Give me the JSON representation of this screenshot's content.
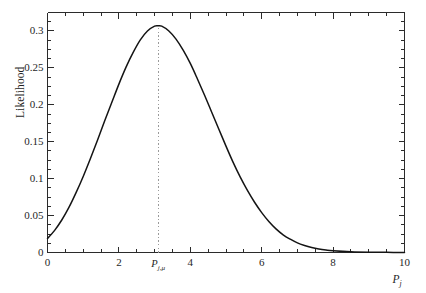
{
  "chart_data": {
    "type": "line",
    "title": "",
    "subtitle": "",
    "xlabel": "P_j",
    "xlabel_base": "P",
    "xlabel_sub": "j",
    "ylabel": "Likelihood",
    "xlim": [
      0,
      10
    ],
    "ylim": [
      0,
      0.325
    ],
    "grid": false,
    "legend": null,
    "x_ticks_major": [
      0,
      2,
      4,
      6,
      8,
      10
    ],
    "x_tick_labels": [
      "0",
      "2",
      "4",
      "6",
      "8",
      "10"
    ],
    "x_minor_step": 0.5,
    "y_ticks_major": [
      0,
      0.05,
      0.1,
      0.15,
      0.2,
      0.25,
      0.3
    ],
    "y_tick_labels": [
      "0",
      "0.05",
      "0.1",
      "0.15",
      "0.2",
      "0.25",
      "0.3"
    ],
    "y_minor_step": 0.0125,
    "curve_color": "#141414",
    "annotations": [
      {
        "name": "peak-marker",
        "kind": "vertical-dotted-line",
        "x": 3.1,
        "label_base": "P",
        "label_sub": "j,μ",
        "label_text": "P_{j,μ}",
        "color": "#9a9a9a"
      }
    ],
    "peak": {
      "x": 3.1,
      "y": 0.307
    },
    "value_at_x0": 0.019,
    "series": [
      {
        "name": "Likelihood",
        "x": [
          0.0,
          0.2,
          0.4,
          0.6,
          0.8,
          1.0,
          1.2,
          1.4,
          1.6,
          1.8,
          2.0,
          2.2,
          2.4,
          2.6,
          2.8,
          3.0,
          3.1,
          3.2,
          3.4,
          3.6,
          3.8,
          4.0,
          4.2,
          4.4,
          4.6,
          4.8,
          5.0,
          5.2,
          5.4,
          5.6,
          5.8,
          6.0,
          6.2,
          6.4,
          6.6,
          6.8,
          7.0,
          7.2,
          7.4,
          7.6,
          7.8,
          8.0,
          8.5,
          9.0,
          9.5,
          10.0
        ],
        "y": [
          0.019,
          0.03,
          0.044,
          0.061,
          0.081,
          0.103,
          0.127,
          0.152,
          0.178,
          0.203,
          0.228,
          0.251,
          0.271,
          0.288,
          0.3,
          0.3065,
          0.307,
          0.3065,
          0.3,
          0.289,
          0.274,
          0.256,
          0.235,
          0.213,
          0.19,
          0.167,
          0.144,
          0.122,
          0.102,
          0.084,
          0.068,
          0.054,
          0.042,
          0.032,
          0.024,
          0.018,
          0.013,
          0.0095,
          0.0068,
          0.0048,
          0.0034,
          0.0024,
          0.001,
          0.0004,
          0.0002,
          0.0001
        ]
      }
    ]
  },
  "figure": {
    "background": "#ffffff",
    "frame_color": "#2b2b2b"
  }
}
